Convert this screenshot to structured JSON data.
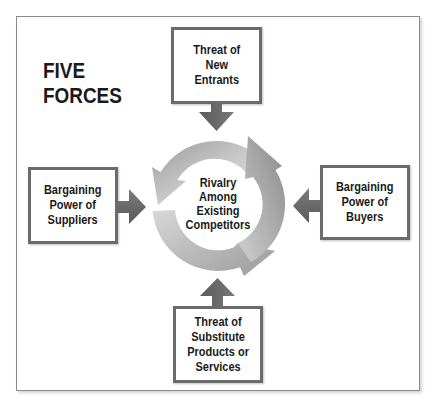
{
  "diagram": {
    "title_lines": [
      "FIVE",
      "FORCES"
    ],
    "center": {
      "label": "Rivalry\nAmong\nExisting\nCompetitors",
      "icon": "cycle-arrows-icon"
    },
    "forces": {
      "top": {
        "label": "Threat of\nNew\nEntrants",
        "arrow_direction": "down"
      },
      "left": {
        "label": "Bargaining\nPower of\nSuppliers",
        "arrow_direction": "right"
      },
      "right": {
        "label": "Bargaining\nPower of\nBuyers",
        "arrow_direction": "left"
      },
      "bottom": {
        "label": "Threat of\nSubstitute\nProducts or\nServices",
        "arrow_direction": "up"
      }
    },
    "colors": {
      "box_border": "#6b6b6b",
      "arrow_fill": "#666666",
      "cycle_light": "#d4d4d4",
      "cycle_dark": "#8c8c8c",
      "text": "#1a1a1a",
      "frame_border": "#8a8a8a"
    }
  }
}
